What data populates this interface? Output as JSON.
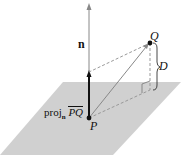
{
  "diagram": {
    "labels": {
      "normal": "n",
      "point_q": "Q",
      "point_p": "P",
      "distance": "D",
      "projection_prefix": "proj",
      "projection_sub": "n",
      "projection_vector": "PQ"
    },
    "colors": {
      "plane": "#cfcfcf",
      "line": "#888888",
      "bold_vector": "#111111",
      "dashed": "#999999"
    },
    "points": {
      "P": [
        89,
        118
      ],
      "Q": [
        150,
        43
      ]
    }
  }
}
